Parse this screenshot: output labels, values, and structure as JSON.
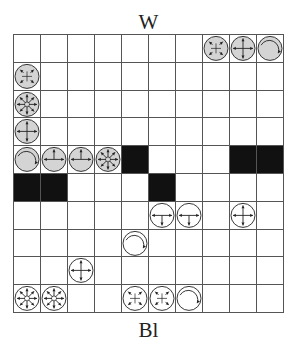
{
  "labels": {
    "top": "W",
    "bottom": "Bl"
  },
  "board": {
    "rows": 10,
    "cols": 10,
    "colors": {
      "grid_line": "#555555",
      "blocked": "#111111",
      "piece_grey": "#d4d4d4",
      "piece_white": "#ffffff",
      "ink": "#222222"
    },
    "blocked": [
      {
        "row": 4,
        "col": 4
      },
      {
        "row": 4,
        "col": 8
      },
      {
        "row": 4,
        "col": 9
      },
      {
        "row": 5,
        "col": 0
      },
      {
        "row": 5,
        "col": 1
      },
      {
        "row": 5,
        "col": 5
      }
    ],
    "pieces": [
      {
        "row": 0,
        "col": 7,
        "type": "diagonal",
        "side": "W",
        "fill": "grey"
      },
      {
        "row": 0,
        "col": 8,
        "type": "four-way",
        "side": "W",
        "fill": "grey"
      },
      {
        "row": 0,
        "col": 9,
        "type": "rotate",
        "side": "W",
        "fill": "grey"
      },
      {
        "row": 1,
        "col": 0,
        "type": "diagonal",
        "side": "W",
        "fill": "grey"
      },
      {
        "row": 2,
        "col": 0,
        "type": "eight-way",
        "side": "W",
        "fill": "grey"
      },
      {
        "row": 3,
        "col": 0,
        "type": "four-way",
        "side": "W",
        "fill": "grey"
      },
      {
        "row": 4,
        "col": 0,
        "type": "rotate",
        "side": "W",
        "fill": "grey"
      },
      {
        "row": 4,
        "col": 1,
        "type": "t-up",
        "side": "W",
        "fill": "grey"
      },
      {
        "row": 4,
        "col": 2,
        "type": "t-up",
        "side": "W",
        "fill": "grey"
      },
      {
        "row": 4,
        "col": 3,
        "type": "eight-way",
        "side": "W",
        "fill": "grey"
      },
      {
        "row": 6,
        "col": 5,
        "type": "t-down",
        "side": "Bl",
        "fill": "white"
      },
      {
        "row": 6,
        "col": 6,
        "type": "t-down",
        "side": "Bl",
        "fill": "white"
      },
      {
        "row": 6,
        "col": 8,
        "type": "four-way",
        "side": "Bl",
        "fill": "white"
      },
      {
        "row": 7,
        "col": 4,
        "type": "rotate",
        "side": "Bl",
        "fill": "white"
      },
      {
        "row": 8,
        "col": 2,
        "type": "four-way",
        "side": "Bl",
        "fill": "white"
      },
      {
        "row": 9,
        "col": 0,
        "type": "eight-way",
        "side": "Bl",
        "fill": "white"
      },
      {
        "row": 9,
        "col": 1,
        "type": "eight-way",
        "side": "Bl",
        "fill": "white"
      },
      {
        "row": 9,
        "col": 4,
        "type": "diagonal",
        "side": "Bl",
        "fill": "white"
      },
      {
        "row": 9,
        "col": 5,
        "type": "diagonal",
        "side": "Bl",
        "fill": "white"
      },
      {
        "row": 9,
        "col": 6,
        "type": "rotate",
        "side": "Bl",
        "fill": "white"
      }
    ]
  }
}
